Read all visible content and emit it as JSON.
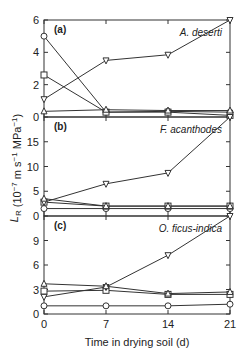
{
  "chart_data": {
    "type": "line",
    "xlabel": "Time in drying soil  (d)",
    "ylabel": "L_R (10^-7 m s^-1 MPa^-1)",
    "x": [
      0,
      7,
      14,
      21
    ],
    "x_ticks": [
      "0",
      "7",
      "14",
      "21"
    ],
    "panels": [
      {
        "label": "(a)",
        "species": "A. deserti",
        "ylim": [
          0,
          6
        ],
        "y_ticks": [
          0,
          2,
          4,
          6
        ],
        "series": [
          {
            "marker": "circle",
            "values": [
              5.0,
              0.3,
              0.35,
              0.3
            ]
          },
          {
            "marker": "square",
            "values": [
              2.6,
              0.3,
              0.3,
              0.1
            ]
          },
          {
            "marker": "triangle-down",
            "values": [
              1.1,
              3.5,
              3.85,
              6.0
            ]
          },
          {
            "marker": "triangle-up",
            "values": [
              0.35,
              0.45,
              0.4,
              0.4
            ]
          }
        ]
      },
      {
        "label": "(b)",
        "species": "F. acanthodes",
        "ylim": [
          0,
          20
        ],
        "y_ticks": [
          0,
          5,
          10,
          15
        ],
        "series": [
          {
            "marker": "circle",
            "values": [
              1.5,
              1.5,
              1.5,
              1.5
            ]
          },
          {
            "marker": "square",
            "values": [
              2.8,
              2.0,
              2.0,
              2.0
            ]
          },
          {
            "marker": "triangle-down",
            "values": [
              2.8,
              6.5,
              8.7,
              20.0
            ]
          },
          {
            "marker": "triangle-up",
            "values": [
              3.5,
              2.0,
              2.0,
              2.0
            ]
          }
        ]
      },
      {
        "label": "(c)",
        "species": "O. ficus-indica",
        "ylim": [
          0,
          12
        ],
        "y_ticks": [
          0,
          3,
          6,
          9
        ],
        "series": [
          {
            "marker": "circle",
            "values": [
              1.0,
              1.0,
              1.0,
              1.2
            ]
          },
          {
            "marker": "square",
            "values": [
              2.8,
              2.9,
              2.4,
              2.4
            ]
          },
          {
            "marker": "triangle-down",
            "values": [
              2.1,
              3.3,
              7.2,
              12.0
            ]
          },
          {
            "marker": "triangle-up",
            "values": [
              3.7,
              3.4,
              2.5,
              2.7
            ]
          }
        ]
      }
    ]
  }
}
